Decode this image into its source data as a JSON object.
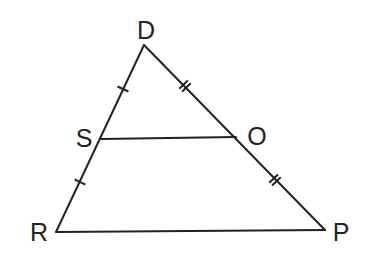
{
  "diagram": {
    "type": "triangle-midsegment",
    "stroke_color": "#222222",
    "background": "#ffffff",
    "vertices": {
      "D": {
        "label": "D",
        "x": 144,
        "y": 45,
        "label_x": 146,
        "label_y": 30
      },
      "R": {
        "label": "R",
        "x": 56,
        "y": 232,
        "label_x": 39,
        "label_y": 232
      },
      "P": {
        "label": "P",
        "x": 325,
        "y": 230,
        "label_x": 341,
        "label_y": 232
      }
    },
    "points": {
      "S": {
        "label": "S",
        "x": 101,
        "y": 139,
        "label_x": 84,
        "label_y": 138
      },
      "O": {
        "label": "O",
        "x": 236,
        "y": 137,
        "label_x": 257,
        "label_y": 136
      }
    },
    "segments": [
      {
        "from": "D",
        "to": "R"
      },
      {
        "from": "D",
        "to": "P"
      },
      {
        "from": "R",
        "to": "P"
      },
      {
        "from": "S",
        "to": "O"
      }
    ],
    "tick_marks": [
      {
        "segment": "DS",
        "count": 1,
        "x": 123,
        "y": 89
      },
      {
        "segment": "SR",
        "count": 1,
        "x": 80,
        "y": 182
      },
      {
        "segment": "DO",
        "count": 2,
        "x": 185,
        "y": 86
      },
      {
        "segment": "OP",
        "count": 2,
        "x": 275,
        "y": 180
      }
    ]
  }
}
